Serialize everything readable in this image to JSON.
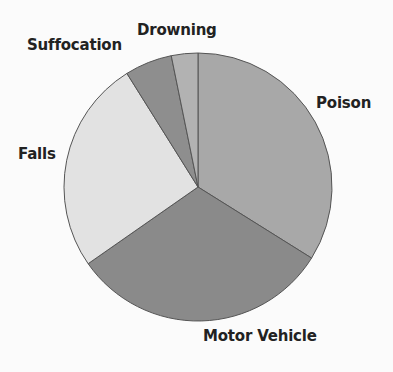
{
  "chart_data": {
    "type": "pie",
    "title": "",
    "start_angle_deg": 0,
    "direction": "clockwise",
    "labels": [
      "Poison",
      "Motor Vehicle",
      "Falls",
      "Suffocation",
      "Drowning"
    ],
    "values": [
      33.9,
      31.4,
      25.8,
      5.7,
      3.2
    ],
    "unit": "percent (estimated from slice angles)",
    "colors": [
      "#a8a8a8",
      "#8a8a8a",
      "#e2e2e2",
      "#8e8e8e",
      "#b2b2b2"
    ],
    "legend": "none (direct labels)",
    "label_positions": {
      "Poison": [
        316,
        96
      ],
      "Motor Vehicle": [
        203,
        329
      ],
      "Falls": [
        18,
        147
      ],
      "Suffocation": [
        27,
        38
      ],
      "Drowning": [
        137,
        23
      ]
    }
  },
  "pie": {
    "center": [
      198,
      187
    ],
    "radius": 134,
    "stroke": "#555555"
  }
}
